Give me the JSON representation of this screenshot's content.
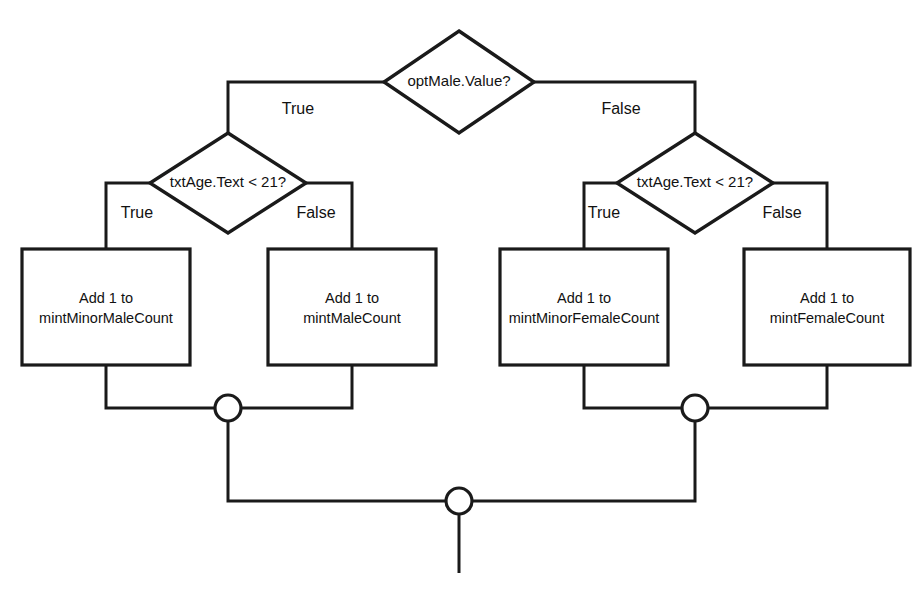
{
  "diagram": {
    "type": "flowchart",
    "canvas": {
      "width": 912,
      "height": 593,
      "background": "#ffffff"
    },
    "line_color": "#1a1a1a",
    "text_color": "#111111",
    "decisions": [
      {
        "id": "opt-male-value",
        "label": "optMale.Value?",
        "cx": 459,
        "cy": 82,
        "rx": 75,
        "ry": 51,
        "true_branch": "age-check-male",
        "false_branch": "age-check-female"
      },
      {
        "id": "age-check-male",
        "label": "txtAge.Text < 21?",
        "cx": 228,
        "cy": 183,
        "rx": 78,
        "ry": 50,
        "true_branch": "add-minor-male",
        "false_branch": "add-male"
      },
      {
        "id": "age-check-female",
        "label": "txtAge.Text < 21?",
        "cx": 695,
        "cy": 183,
        "rx": 78,
        "ry": 50,
        "true_branch": "add-minor-female",
        "false_branch": "add-female"
      }
    ],
    "processes": [
      {
        "id": "add-minor-male",
        "line1": "Add 1 to",
        "line2": "mintMinorMaleCount",
        "x": 22,
        "y": 249,
        "width": 168,
        "height": 116
      },
      {
        "id": "add-male",
        "line1": "Add 1 to",
        "line2": "mintMaleCount",
        "x": 268,
        "y": 249,
        "width": 168,
        "height": 116
      },
      {
        "id": "add-minor-female",
        "line1": "Add 1 to",
        "line2": "mintMinorFemaleCount",
        "x": 500,
        "y": 249,
        "width": 168,
        "height": 116
      },
      {
        "id": "add-female",
        "line1": "Add 1 to",
        "line2": "mintFemaleCount",
        "x": 744,
        "y": 249,
        "width": 166,
        "height": 116
      }
    ],
    "connectors": [
      {
        "id": "merge-male",
        "cx": 228,
        "cy": 408,
        "r": 13
      },
      {
        "id": "merge-female",
        "cx": 695,
        "cy": 408,
        "r": 13
      },
      {
        "id": "merge-all",
        "cx": 459,
        "cy": 501,
        "r": 13
      }
    ],
    "edge_labels": [
      {
        "id": "top-true",
        "text": "True",
        "x": 298,
        "y": 110
      },
      {
        "id": "top-false",
        "text": "False",
        "x": 621,
        "y": 110
      },
      {
        "id": "male-true",
        "text": "True",
        "x": 137,
        "y": 214
      },
      {
        "id": "male-false",
        "text": "False",
        "x": 316,
        "y": 214
      },
      {
        "id": "female-true",
        "text": "True",
        "x": 604,
        "y": 214
      },
      {
        "id": "female-false",
        "text": "False",
        "x": 782,
        "y": 214
      }
    ],
    "edges": [
      {
        "id": "edge-top-true",
        "path": "M 384 82 L 228 82 L 228 133"
      },
      {
        "id": "edge-top-false",
        "path": "M 534 82 L 695 82 L 695 133"
      },
      {
        "id": "edge-male-true",
        "path": "M 150 183 L 106 183 L 106 249"
      },
      {
        "id": "edge-male-false",
        "path": "M 306 183 L 352 183 L 352 249"
      },
      {
        "id": "edge-female-true",
        "path": "M 617 183 L 584 183 L 584 249"
      },
      {
        "id": "edge-female-false",
        "path": "M 773 183 L 827 183 L 827 249"
      },
      {
        "id": "edge-minor-male-down",
        "path": "M 106 365 L 106 408 L 215 408"
      },
      {
        "id": "edge-male-down",
        "path": "M 352 365 L 352 408 L 241 408"
      },
      {
        "id": "edge-minor-female-down",
        "path": "M 584 365 L 584 408 L 682 408"
      },
      {
        "id": "edge-female-down",
        "path": "M 827 365 L 827 408 L 708 408"
      },
      {
        "id": "edge-merge-male-to-all",
        "path": "M 228 421 L 228 501 L 446 501"
      },
      {
        "id": "edge-merge-female-to-all",
        "path": "M 695 421 L 695 501 L 472 501"
      },
      {
        "id": "edge-exit",
        "path": "M 459 514 L 459 573"
      }
    ]
  }
}
